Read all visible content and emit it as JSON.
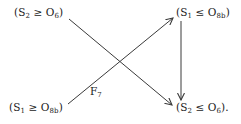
{
  "diagram": {
    "type": "directed-graph",
    "nodes": {
      "top_left": {
        "open": "(S",
        "sub1": "2",
        "op": " ≥ O",
        "sub2": "6",
        "close": ")"
      },
      "top_right": {
        "open": "(S",
        "sub1": "1",
        "op": " ≤ O",
        "sub2": "8b",
        "close": ")"
      },
      "bottom_left": {
        "open": "(S",
        "sub1": "1",
        "op": " ≥ O",
        "sub2": "8b",
        "close": ")"
      },
      "bottom_right": {
        "open": "(S",
        "sub1": "2",
        "op": " ≤ O",
        "sub2": "6",
        "close": ")."
      }
    },
    "edges": [
      {
        "from": "top_left",
        "to": "bottom_right",
        "label": ""
      },
      {
        "from": "bottom_left",
        "to": "top_right",
        "label": "F7"
      },
      {
        "from": "top_right",
        "to": "bottom_right",
        "label": ""
      }
    ],
    "edge_label": {
      "main": "F",
      "sub": "7"
    },
    "colors": {
      "line": "#3a3a3a",
      "text": "#1a1a1a",
      "background": "#ffffff"
    }
  }
}
